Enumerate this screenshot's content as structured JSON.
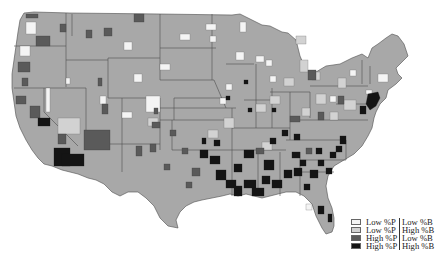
{
  "map": {
    "title": "",
    "region": "Contiguous United States",
    "unit": "county",
    "colors": {
      "background": "#ffffff",
      "base": "#a8a8a8",
      "border": "#4e4e4e",
      "low_p_low_b": "#f4f4f4",
      "low_p_high_b": "#d2d2d2",
      "high_p_low_b": "#5a5a5a",
      "high_p_high_b": "#141414"
    }
  },
  "legend": {
    "items": [
      {
        "p": "Low %P",
        "b": "Low %B",
        "color": "#f4f4f4",
        "category": "low_p_low_b"
      },
      {
        "p": "Low %P",
        "b": "High %B",
        "color": "#d2d2d2",
        "category": "low_p_high_b"
      },
      {
        "p": "High %P",
        "b": "Low %B",
        "color": "#5a5a5a",
        "category": "high_p_low_b"
      },
      {
        "p": "High %P",
        "b": "High %B",
        "color": "#141414",
        "category": "high_p_high_b"
      }
    ]
  }
}
